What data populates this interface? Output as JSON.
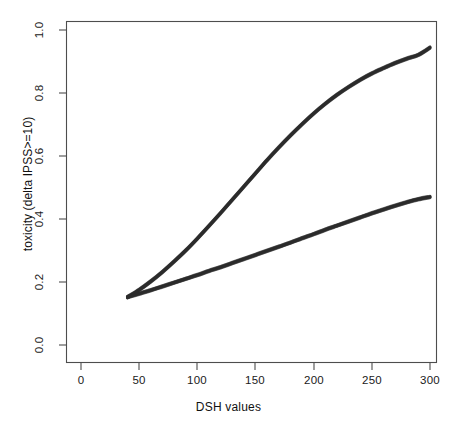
{
  "chart_data": {
    "type": "line",
    "title": "",
    "xlabel": "DSH values",
    "ylabel": "toxicity (delta IPSS>=10)",
    "xlim": [
      0,
      315
    ],
    "ylim": [
      0.0,
      1.05
    ],
    "xticks": [
      0,
      50,
      100,
      150,
      200,
      250,
      300
    ],
    "xtick_labels": [
      "0",
      "50",
      "100",
      "150",
      "200",
      "250",
      "300"
    ],
    "yticks": [
      0.0,
      0.2,
      0.4,
      0.6,
      0.8,
      1.0
    ],
    "ytick_labels": [
      "0.0",
      "0.2",
      "0.4",
      "0.6",
      "0.8",
      "1.0"
    ],
    "grid": false,
    "legend": null,
    "line_color": "#2b2b2b",
    "line_width": 3.2,
    "frame": true,
    "x_range_data": [
      40,
      300
    ],
    "series": [
      {
        "name": "upper-curve",
        "x": [
          40,
          50,
          60,
          70,
          80,
          90,
          100,
          110,
          120,
          130,
          140,
          150,
          160,
          170,
          180,
          190,
          200,
          210,
          220,
          230,
          240,
          250,
          260,
          270,
          280,
          290,
          300
        ],
        "values": [
          0.152,
          0.175,
          0.202,
          0.232,
          0.265,
          0.3,
          0.338,
          0.378,
          0.419,
          0.461,
          0.503,
          0.545,
          0.587,
          0.627,
          0.665,
          0.701,
          0.735,
          0.766,
          0.794,
          0.819,
          0.842,
          0.862,
          0.879,
          0.895,
          0.909,
          0.921,
          0.944
        ]
      },
      {
        "name": "lower-curve",
        "x": [
          40,
          50,
          60,
          70,
          80,
          90,
          100,
          110,
          120,
          130,
          140,
          150,
          160,
          170,
          180,
          190,
          200,
          210,
          220,
          230,
          240,
          250,
          260,
          270,
          280,
          290,
          300
        ],
        "values": [
          0.152,
          0.163,
          0.174,
          0.186,
          0.198,
          0.21,
          0.222,
          0.235,
          0.247,
          0.26,
          0.273,
          0.286,
          0.299,
          0.312,
          0.325,
          0.339,
          0.352,
          0.366,
          0.379,
          0.392,
          0.405,
          0.418,
          0.43,
          0.442,
          0.453,
          0.463,
          0.47
        ]
      }
    ]
  },
  "axis": {
    "x_title": "DSH values",
    "y_title": "toxicity (delta IPSS>=10)",
    "x_tick_0": "0",
    "x_tick_1": "50",
    "x_tick_2": "100",
    "x_tick_3": "150",
    "x_tick_4": "200",
    "x_tick_5": "250",
    "x_tick_6": "300",
    "y_tick_0": "0.0",
    "y_tick_1": "0.2",
    "y_tick_2": "0.4",
    "y_tick_3": "0.6",
    "y_tick_4": "0.8",
    "y_tick_5": "1.0"
  }
}
